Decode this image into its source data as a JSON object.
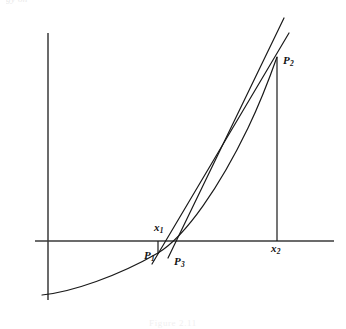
{
  "figure": {
    "top_running_text": "gy on",
    "caption": "Figure 2.11",
    "axes": {
      "x_axis_name": "horizontal-axis",
      "y_axis_name": "vertical-axis",
      "origin_x": 48,
      "origin_y": 241,
      "x_axis_start": 35,
      "x_axis_end": 334,
      "y_axis_top": 33,
      "y_axis_bottom": 300
    },
    "points": [
      {
        "id": "P1",
        "label": "P",
        "subscript": "1",
        "x": 158,
        "y": 253
      },
      {
        "id": "P2",
        "label": "P",
        "subscript": "2",
        "x": 277,
        "y": 57
      },
      {
        "id": "P3",
        "label": "P",
        "subscript": "3",
        "x": 172,
        "y": 250
      }
    ],
    "axis_marks": [
      {
        "id": "x1",
        "label": "x",
        "subscript": "1",
        "x": 158,
        "side": "above"
      },
      {
        "id": "x2",
        "label": "x",
        "subscript": "2",
        "x": 277,
        "side": "below"
      }
    ],
    "curve": {
      "name": "function-curve",
      "path": "M 42 295 C 72 292, 118 276, 158 253 C 186 236, 220 186, 248 128 C 261 101, 271 74, 277 57",
      "stroke": "#1a1a1a",
      "width": 1.2
    },
    "secants": [
      {
        "name": "secant-p1-p2",
        "from": "P1",
        "to": "P2",
        "x1": 152,
        "y1": 264,
        "x2": 289,
        "y2": 33,
        "stroke": "#1a1a1a",
        "width": 1.2
      },
      {
        "name": "secant-p3-p2",
        "from": "P3",
        "to": "P2",
        "x1": 168,
        "y1": 258,
        "x2": 284,
        "y2": 18,
        "stroke": "#1a1a1a",
        "width": 1.2
      }
    ],
    "droplines": [
      {
        "name": "dropline-x1",
        "x": 158,
        "y_top": 241,
        "y_bottom": 254
      },
      {
        "name": "dropline-x2",
        "x": 277,
        "y_top": 57,
        "y_bottom": 241
      }
    ],
    "colors": {
      "ink": "#1a1a1a",
      "axis": "#3a3a3a",
      "paper": "#ffffff",
      "ghost_text": "#ededed"
    }
  }
}
